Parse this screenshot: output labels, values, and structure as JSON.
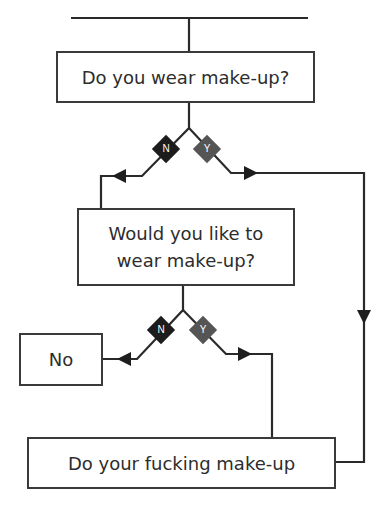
{
  "diagram": {
    "type": "flowchart",
    "colors": {
      "line": "#2a2a2a",
      "no_diamond": "#1c1c1c",
      "yes_diamond": "#555555"
    },
    "nodes": {
      "q1": "Do you wear make-up?",
      "q2": "Would you like to wear make-up?",
      "no": "No",
      "end": "Do your fucking make-up"
    },
    "q2_lines": [
      "Would you like to",
      "wear make-up?"
    ],
    "branch_labels": {
      "no": "N",
      "yes": "Y"
    },
    "edges": [
      {
        "from": "start",
        "to": "q1"
      },
      {
        "from": "q1",
        "to": "q2",
        "label": "N"
      },
      {
        "from": "q1",
        "to": "end",
        "label": "Y"
      },
      {
        "from": "q2",
        "to": "no",
        "label": "N"
      },
      {
        "from": "q2",
        "to": "end",
        "label": "Y"
      }
    ]
  }
}
